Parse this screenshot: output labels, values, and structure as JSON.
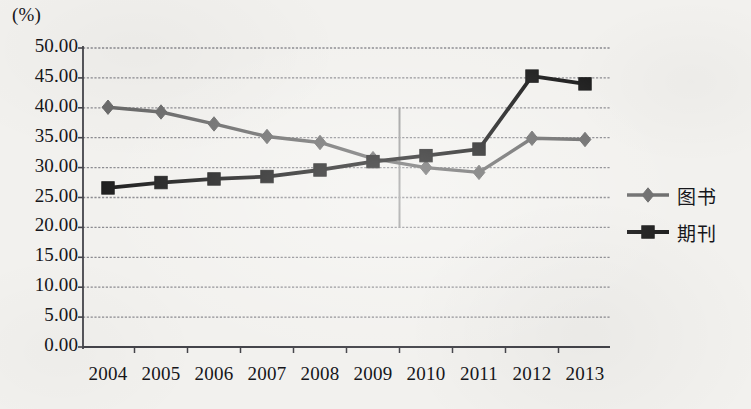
{
  "chart_data": {
    "type": "line",
    "title": "",
    "subtitle": "",
    "xlabel": "",
    "ylabel": "(%)",
    "unit_label": "(%)",
    "categories": [
      "2004",
      "2005",
      "2006",
      "2007",
      "2008",
      "2009",
      "2010",
      "2011",
      "2012",
      "2013"
    ],
    "x": [
      2004,
      2005,
      2006,
      2007,
      2008,
      2009,
      2010,
      2011,
      2012,
      2013
    ],
    "ylim": [
      0,
      50
    ],
    "ytick_step": 5,
    "ytick_labels": [
      "50.00",
      "45.00",
      "40.00",
      "35.00",
      "30.00",
      "25.00",
      "20.00",
      "15.00",
      "10.00",
      "5.00",
      "0.00"
    ],
    "ytick_values": [
      50,
      45,
      40,
      35,
      30,
      25,
      20,
      15,
      10,
      5,
      0
    ],
    "grid": true,
    "grid_axis": "y",
    "legend_position": "right",
    "series": [
      {
        "name": "图书",
        "marker": "diamond",
        "color": "#6b6b6b",
        "values": [
          40.1,
          39.3,
          37.3,
          35.2,
          34.2,
          31.5,
          30.0,
          29.2,
          34.9,
          34.7
        ]
      },
      {
        "name": "期刊",
        "marker": "square",
        "color": "#1c1c1c",
        "values": [
          26.6,
          27.5,
          28.1,
          28.5,
          29.6,
          31.0,
          32.0,
          33.1,
          45.3,
          44.0
        ]
      }
    ],
    "annotations": [
      {
        "type": "vertical-reference-line",
        "x_position": 2009.5,
        "y_from": 20,
        "y_to": 40,
        "color": "#9a9a9a"
      }
    ]
  },
  "legend": {
    "items": [
      {
        "label": "图书",
        "marker": "diamond",
        "color": "#6b6b6b"
      },
      {
        "label": "期刊",
        "marker": "square",
        "color": "#1c1c1c"
      }
    ]
  },
  "colors": {
    "background": "#f2f1ee",
    "axis": "#44444a",
    "grid": "#8b8b90",
    "text": "#16161a",
    "series_books": "#6b6b6b",
    "series_periodicals": "#1c1c1c",
    "reference_line": "#9a9a9a"
  }
}
